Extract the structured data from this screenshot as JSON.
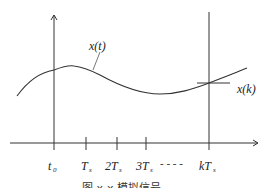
{
  "diagram": {
    "signal_label": "x(t)",
    "sample_label": "x(k)",
    "ticks": [
      {
        "main": "t",
        "sub": "0"
      },
      {
        "main": "T",
        "sub": "s"
      },
      {
        "main": "2T",
        "sub": "s"
      },
      {
        "main": "3T",
        "sub": "s"
      },
      {
        "main": "kT",
        "sub": "s"
      }
    ],
    "ellipsis": "- - - -",
    "caption": "图 x-x 模拟信号",
    "colors": {
      "line": "#333333",
      "background": "#ffffff"
    }
  }
}
